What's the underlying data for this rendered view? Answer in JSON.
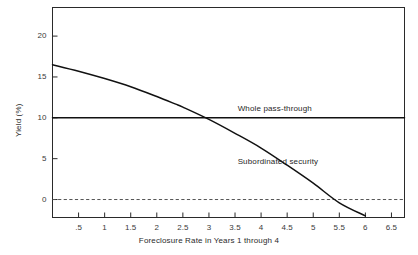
{
  "chart_data": {
    "type": "line",
    "title": "",
    "xlabel": "Foreclosure Rate in Years 1 through 4",
    "ylabel": "Yield (%)",
    "xlim": [
      0,
      6.75
    ],
    "ylim": [
      -2.2,
      23.5
    ],
    "grid": false,
    "legend_position": "inline-annotation",
    "xticks": [
      0.5,
      1,
      1.5,
      2,
      2.5,
      3,
      3.5,
      4,
      4.5,
      5,
      5.5,
      6,
      6.5
    ],
    "xtick_labels": [
      ".5",
      "1",
      "1.5",
      "2",
      "2.5",
      "3",
      "3.5",
      "4",
      "4.5",
      "5",
      "5.5",
      "6",
      "6.5"
    ],
    "yticks": [
      0,
      5,
      10,
      15,
      20
    ],
    "ytick_labels": [
      "0",
      "5",
      "10",
      "15",
      "20"
    ],
    "zero_reference_line": {
      "value": 0,
      "style": "dashed",
      "color": "#555555"
    },
    "series": [
      {
        "name": "Whole pass-through",
        "style": "solid",
        "color": "#111111",
        "x": [
          0,
          6.75
        ],
        "values": [
          10,
          10
        ]
      },
      {
        "name": "Subordinated security",
        "style": "solid",
        "color": "#111111",
        "x": [
          0,
          0.5,
          1,
          1.5,
          2,
          2.35,
          2.5,
          3,
          3.5,
          4,
          4.5,
          5,
          5.5,
          6
        ],
        "values": [
          16.5,
          15.7,
          14.8,
          13.8,
          12.6,
          11.7,
          11.3,
          9.8,
          8.1,
          6.3,
          4.2,
          2.0,
          -0.4,
          -2.0
        ]
      }
    ],
    "annotations": [
      {
        "text": "Whole pass-through",
        "x": 3.55,
        "y": 11.1
      },
      {
        "text": "Subordinated security",
        "x": 3.55,
        "y": 4.6
      }
    ]
  }
}
